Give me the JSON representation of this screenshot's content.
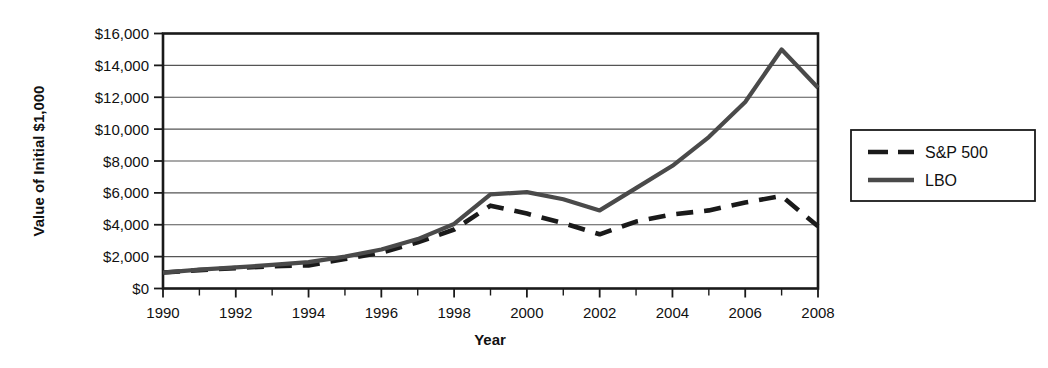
{
  "chart_data": {
    "type": "line",
    "title": "",
    "xlabel": "Year",
    "ylabel": "Value of Initial $1,000",
    "x": [
      1990,
      1991,
      1992,
      1993,
      1994,
      1995,
      1996,
      1997,
      1998,
      1999,
      2000,
      2001,
      2002,
      2003,
      2004,
      2005,
      2006,
      2007,
      2008
    ],
    "xlim": [
      1990,
      2008
    ],
    "ylim": [
      0,
      16000
    ],
    "ytick_values": [
      0,
      2000,
      4000,
      6000,
      8000,
      10000,
      12000,
      14000,
      16000
    ],
    "ytick_labels": [
      "$0",
      "$2,000",
      "$4,000",
      "$6,000",
      "$8,000",
      "$10,000",
      "$12,000",
      "$14,000",
      "$16,000"
    ],
    "xtick_values": [
      1990,
      1992,
      1994,
      1996,
      1998,
      2000,
      2002,
      2004,
      2006,
      2008
    ],
    "xtick_labels": [
      "1990",
      "1992",
      "1994",
      "1996",
      "1998",
      "2000",
      "2002",
      "2004",
      "2006",
      "2008"
    ],
    "minor_xtick_values": [
      1991,
      1993,
      1995,
      1997,
      1999,
      2001,
      2003,
      2005,
      2007
    ],
    "grid": "horizontal",
    "legend_position": "right-outside",
    "series": [
      {
        "name": "S&P 500",
        "style": "dashed",
        "color": "#1a1a1a",
        "values": [
          1000,
          1150,
          1280,
          1400,
          1450,
          1850,
          2250,
          2900,
          3700,
          5200,
          4700,
          4100,
          3400,
          4200,
          4650,
          4900,
          5400,
          5800,
          3900
        ]
      },
      {
        "name": "LBO",
        "style": "solid",
        "color": "#4a4a4a",
        "values": [
          1000,
          1180,
          1320,
          1480,
          1650,
          2000,
          2450,
          3100,
          4050,
          5900,
          6050,
          5600,
          4900,
          6300,
          7700,
          9500,
          11700,
          15000,
          12600
        ]
      }
    ]
  },
  "legend": {
    "items": [
      {
        "label": "S&P 500",
        "style": "dashed"
      },
      {
        "label": "LBO",
        "style": "solid"
      }
    ]
  }
}
